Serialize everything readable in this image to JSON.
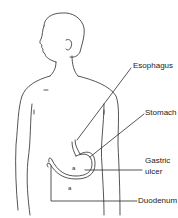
{
  "diagram": {
    "type": "anatomical-illustration",
    "labels": [
      {
        "id": "esophagus",
        "text": "Esophagus"
      },
      {
        "id": "stomach",
        "text": "Stomach"
      },
      {
        "id": "gastric_ulcer",
        "line1": "Gastric",
        "line2": "ulcer"
      },
      {
        "id": "duodenum",
        "text": "Duodenum"
      }
    ],
    "markers": {
      "ulcer_mark": "a",
      "duodenum_mark": "a"
    },
    "colors": {
      "line": "#2a2a2a",
      "background": "#ffffff"
    }
  }
}
